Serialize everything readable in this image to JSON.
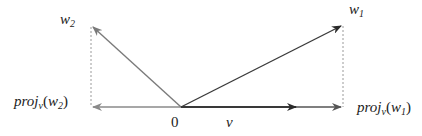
{
  "diagram": {
    "labels": {
      "w1_base": "w",
      "w1_sub": "1",
      "w2_base": "w",
      "w2_sub": "2",
      "origin": "0",
      "v": "v",
      "proj_w1_prefix": "proj",
      "proj_w1_sub": "v",
      "proj_w1_open": "(",
      "proj_w1_arg": "w",
      "proj_w1_arg_sub": "1",
      "proj_w1_close": ")",
      "proj_w2_prefix": "proj",
      "proj_w2_sub": "v",
      "proj_w2_open": "(",
      "proj_w2_arg": "w",
      "proj_w2_arg_sub": "2",
      "proj_w2_close": ")"
    },
    "colors": {
      "vector_w1": "#3a3a3a",
      "vector_w2": "#7a7a7a",
      "vector_v": "#222222",
      "projection_line": "#888888",
      "dashed_line": "#999999"
    }
  }
}
